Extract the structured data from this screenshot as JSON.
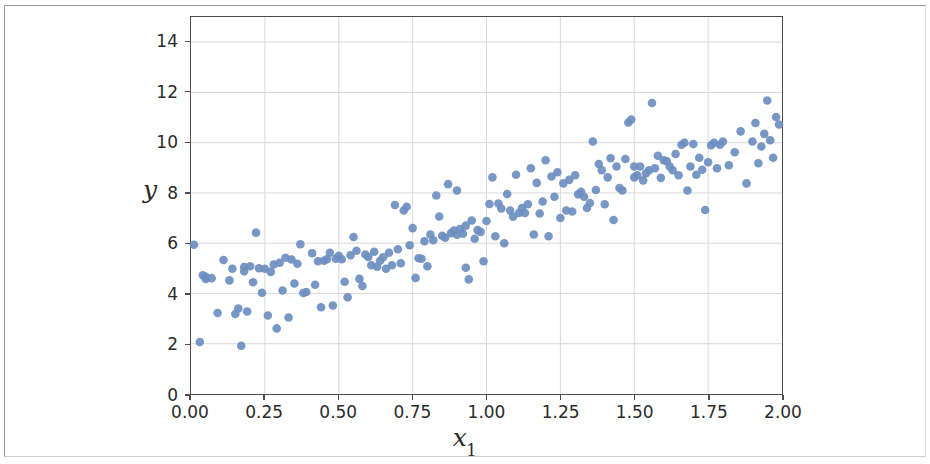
{
  "figure": {
    "background_color": "#ffffff",
    "axes_edge_color": "#4d4d4d",
    "grid_color": "#d9d9d9",
    "marker_color": "#6c8ebf"
  },
  "chart_data": {
    "type": "scatter",
    "title": "",
    "subtitle": "",
    "xlabel": "x",
    "xlabel_sub": "1",
    "ylabel": "y",
    "xlim": [
      0.0,
      2.0
    ],
    "ylim": [
      0.0,
      15.0
    ],
    "xticks": [
      "0.00",
      "0.25",
      "0.50",
      "0.75",
      "1.00",
      "1.25",
      "1.50",
      "1.75",
      "2.00"
    ],
    "xtick_values": [
      0.0,
      0.25,
      0.5,
      0.75,
      1.0,
      1.25,
      1.5,
      1.75,
      2.0
    ],
    "yticks": [
      "0",
      "2",
      "4",
      "6",
      "8",
      "10",
      "12",
      "14"
    ],
    "ytick_values": [
      0,
      2,
      4,
      6,
      8,
      10,
      12,
      14
    ],
    "grid": true,
    "legend": null,
    "marker_size": 4.3,
    "series": [
      {
        "name": "samples",
        "color": "#6c8ebf",
        "points": [
          [
            0.01,
            5.94
          ],
          [
            0.03,
            2.07
          ],
          [
            0.04,
            4.72
          ],
          [
            0.05,
            4.66
          ],
          [
            0.05,
            4.58
          ],
          [
            0.07,
            4.61
          ],
          [
            0.09,
            3.22
          ],
          [
            0.11,
            5.33
          ],
          [
            0.13,
            4.52
          ],
          [
            0.14,
            4.98
          ],
          [
            0.15,
            3.18
          ],
          [
            0.16,
            3.4
          ],
          [
            0.17,
            1.92
          ],
          [
            0.18,
            5.05
          ],
          [
            0.18,
            4.88
          ],
          [
            0.19,
            3.28
          ],
          [
            0.2,
            5.08
          ],
          [
            0.21,
            4.45
          ],
          [
            0.22,
            6.42
          ],
          [
            0.23,
            5.0
          ],
          [
            0.24,
            4.03
          ],
          [
            0.25,
            4.98
          ],
          [
            0.26,
            3.12
          ],
          [
            0.27,
            4.86
          ],
          [
            0.28,
            5.15
          ],
          [
            0.29,
            2.61
          ],
          [
            0.3,
            5.22
          ],
          [
            0.31,
            4.12
          ],
          [
            0.32,
            5.42
          ],
          [
            0.33,
            3.04
          ],
          [
            0.34,
            5.35
          ],
          [
            0.35,
            4.4
          ],
          [
            0.36,
            5.18
          ],
          [
            0.37,
            5.96
          ],
          [
            0.38,
            4.02
          ],
          [
            0.39,
            4.06
          ],
          [
            0.41,
            5.6
          ],
          [
            0.42,
            4.35
          ],
          [
            0.43,
            5.28
          ],
          [
            0.44,
            3.45
          ],
          [
            0.45,
            5.3
          ],
          [
            0.46,
            5.36
          ],
          [
            0.47,
            5.62
          ],
          [
            0.48,
            3.52
          ],
          [
            0.49,
            5.38
          ],
          [
            0.5,
            5.5
          ],
          [
            0.51,
            5.36
          ],
          [
            0.52,
            4.47
          ],
          [
            0.53,
            3.85
          ],
          [
            0.54,
            5.52
          ],
          [
            0.55,
            6.25
          ],
          [
            0.56,
            5.7
          ],
          [
            0.57,
            4.58
          ],
          [
            0.58,
            4.3
          ],
          [
            0.59,
            5.55
          ],
          [
            0.6,
            5.45
          ],
          [
            0.61,
            5.12
          ],
          [
            0.62,
            5.66
          ],
          [
            0.63,
            5.06
          ],
          [
            0.64,
            5.3
          ],
          [
            0.65,
            5.44
          ],
          [
            0.66,
            4.98
          ],
          [
            0.67,
            5.62
          ],
          [
            0.68,
            5.12
          ],
          [
            0.69,
            7.52
          ],
          [
            0.7,
            5.76
          ],
          [
            0.71,
            5.2
          ],
          [
            0.72,
            7.3
          ],
          [
            0.73,
            7.45
          ],
          [
            0.74,
            5.92
          ],
          [
            0.75,
            6.6
          ],
          [
            0.76,
            4.62
          ],
          [
            0.77,
            5.4
          ],
          [
            0.78,
            5.38
          ],
          [
            0.79,
            6.08
          ],
          [
            0.8,
            5.08
          ],
          [
            0.81,
            6.35
          ],
          [
            0.82,
            6.12
          ],
          [
            0.83,
            7.9
          ],
          [
            0.84,
            7.06
          ],
          [
            0.85,
            6.3
          ],
          [
            0.86,
            6.22
          ],
          [
            0.87,
            8.35
          ],
          [
            0.88,
            6.4
          ],
          [
            0.89,
            6.5
          ],
          [
            0.9,
            6.34
          ],
          [
            0.9,
            8.1
          ],
          [
            0.91,
            6.56
          ],
          [
            0.92,
            6.38
          ],
          [
            0.93,
            5.02
          ],
          [
            0.93,
            6.7
          ],
          [
            0.94,
            4.56
          ],
          [
            0.95,
            6.9
          ],
          [
            0.96,
            6.18
          ],
          [
            0.97,
            6.52
          ],
          [
            0.98,
            6.45
          ],
          [
            0.99,
            5.28
          ],
          [
            1.0,
            6.88
          ],
          [
            1.01,
            7.56
          ],
          [
            1.02,
            8.62
          ],
          [
            1.03,
            6.28
          ],
          [
            1.04,
            7.58
          ],
          [
            1.05,
            7.38
          ],
          [
            1.06,
            6.0
          ],
          [
            1.07,
            7.96
          ],
          [
            1.08,
            7.3
          ],
          [
            1.09,
            7.05
          ],
          [
            1.1,
            8.72
          ],
          [
            1.11,
            7.2
          ],
          [
            1.12,
            7.4
          ],
          [
            1.13,
            7.2
          ],
          [
            1.14,
            7.55
          ],
          [
            1.15,
            8.98
          ],
          [
            1.16,
            6.35
          ],
          [
            1.17,
            8.4
          ],
          [
            1.18,
            7.18
          ],
          [
            1.19,
            7.66
          ],
          [
            1.2,
            9.3
          ],
          [
            1.21,
            6.28
          ],
          [
            1.22,
            8.65
          ],
          [
            1.23,
            7.85
          ],
          [
            1.24,
            8.82
          ],
          [
            1.25,
            7.0
          ],
          [
            1.26,
            8.38
          ],
          [
            1.27,
            7.3
          ],
          [
            1.28,
            8.52
          ],
          [
            1.29,
            7.26
          ],
          [
            1.3,
            8.7
          ],
          [
            1.31,
            7.95
          ],
          [
            1.32,
            8.05
          ],
          [
            1.33,
            7.85
          ],
          [
            1.34,
            7.4
          ],
          [
            1.35,
            7.6
          ],
          [
            1.36,
            10.05
          ],
          [
            1.37,
            8.12
          ],
          [
            1.38,
            9.15
          ],
          [
            1.39,
            8.9
          ],
          [
            1.4,
            7.55
          ],
          [
            1.41,
            8.62
          ],
          [
            1.42,
            9.38
          ],
          [
            1.43,
            6.92
          ],
          [
            1.44,
            9.05
          ],
          [
            1.45,
            8.2
          ],
          [
            1.46,
            8.1
          ],
          [
            1.47,
            9.35
          ],
          [
            1.48,
            10.8
          ],
          [
            1.49,
            10.92
          ],
          [
            1.5,
            9.05
          ],
          [
            1.5,
            8.62
          ],
          [
            1.51,
            8.7
          ],
          [
            1.52,
            9.05
          ],
          [
            1.53,
            8.5
          ],
          [
            1.54,
            8.78
          ],
          [
            1.55,
            8.9
          ],
          [
            1.56,
            11.58
          ],
          [
            1.57,
            8.98
          ],
          [
            1.58,
            9.48
          ],
          [
            1.59,
            8.6
          ],
          [
            1.6,
            9.3
          ],
          [
            1.61,
            9.26
          ],
          [
            1.62,
            9.05
          ],
          [
            1.63,
            8.9
          ],
          [
            1.64,
            9.55
          ],
          [
            1.65,
            8.7
          ],
          [
            1.66,
            9.92
          ],
          [
            1.67,
            10.0
          ],
          [
            1.68,
            8.1
          ],
          [
            1.69,
            9.05
          ],
          [
            1.7,
            9.95
          ],
          [
            1.71,
            8.72
          ],
          [
            1.72,
            9.4
          ],
          [
            1.73,
            8.92
          ],
          [
            1.74,
            7.32
          ],
          [
            1.75,
            9.22
          ],
          [
            1.76,
            9.9
          ],
          [
            1.77,
            10.0
          ],
          [
            1.78,
            8.98
          ],
          [
            1.79,
            9.92
          ],
          [
            1.8,
            10.05
          ],
          [
            1.82,
            9.1
          ],
          [
            1.84,
            9.62
          ],
          [
            1.86,
            10.45
          ],
          [
            1.88,
            8.38
          ],
          [
            1.9,
            10.05
          ],
          [
            1.91,
            10.78
          ],
          [
            1.92,
            9.18
          ],
          [
            1.93,
            9.85
          ],
          [
            1.94,
            10.35
          ],
          [
            1.95,
            11.68
          ],
          [
            1.96,
            10.1
          ],
          [
            1.97,
            9.4
          ],
          [
            1.98,
            11.02
          ],
          [
            1.99,
            10.72
          ]
        ]
      }
    ]
  }
}
